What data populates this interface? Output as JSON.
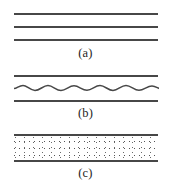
{
  "figure": {
    "type": "scientific-line-diagram",
    "background_color": "#ffffff",
    "line_color": "#474747",
    "label_color": "#1d1d1d",
    "width_px": 171,
    "height_px": 184
  },
  "panels": [
    {
      "id": "a",
      "label": "(a)",
      "description": "three parallel straight horizontal lines",
      "lines": [
        {
          "name": "line-1",
          "style": "straight"
        },
        {
          "name": "line-2",
          "style": "straight"
        },
        {
          "name": "line-3",
          "style": "straight"
        }
      ]
    },
    {
      "id": "b",
      "label": "(b)",
      "description": "two straight horizontal lines with a wavy line between them",
      "lines": [
        {
          "name": "line-top",
          "style": "straight"
        },
        {
          "name": "line-middle",
          "style": "wavy"
        },
        {
          "name": "line-bottom",
          "style": "straight"
        }
      ],
      "wave": {
        "periods": 6,
        "amplitude_px": 2.6
      }
    },
    {
      "id": "c",
      "label": "(c)",
      "description": "two straight horizontal lines enclosing a stippled (dotted) band",
      "lines": [
        {
          "name": "line-top",
          "style": "straight"
        },
        {
          "name": "line-bottom",
          "style": "straight"
        }
      ],
      "fill": {
        "pattern": "stipple-dots",
        "dot_color": "#3a3a3a",
        "background": "#ffffff"
      }
    }
  ]
}
